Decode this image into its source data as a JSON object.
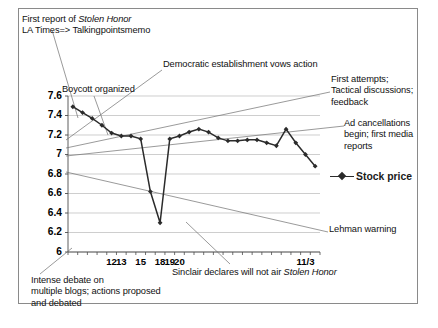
{
  "figure": {
    "border_color": "#8a8a8a",
    "background": "#ffffff"
  },
  "legend": {
    "label": "Stock price",
    "marker_icon": "line-diamond-marker-icon",
    "position": "right-middle"
  },
  "annotations": [
    {
      "id": "first-report",
      "lines": [
        "First report of |Stolen Honor|",
        "LA Times=> Talkingpointsmemo"
      ],
      "x": 22,
      "y": 14
    },
    {
      "id": "boycott",
      "lines": [
        "Boycott organized"
      ],
      "x": 62,
      "y": 84
    },
    {
      "id": "democratic",
      "lines": [
        "Democratic establishment vows action"
      ],
      "x": 163,
      "y": 59
    },
    {
      "id": "first-attempts",
      "lines": [
        "First attempts;",
        "Tactical discussions;",
        "feedback"
      ],
      "x": 331,
      "y": 74
    },
    {
      "id": "ad-cancellations",
      "lines": [
        "Ad cancellations",
        "begin; first media",
        "reports"
      ],
      "x": 344,
      "y": 118
    },
    {
      "id": "lehman",
      "lines": [
        "Lehman warning"
      ],
      "x": 329,
      "y": 224
    },
    {
      "id": "sinclair",
      "lines": [
        "Sinclair declares will not air |Stolen Honor|"
      ],
      "x": 172,
      "y": 267
    },
    {
      "id": "intense-debate",
      "lines": [
        "Intense debate on",
        "multiple blogs; actions proposed",
        "and debated"
      ],
      "x": 31,
      "y": 275
    }
  ],
  "chart_data": {
    "type": "line",
    "title": "",
    "xlabel": "",
    "ylabel": "",
    "ylim": [
      6,
      7.6
    ],
    "yticks": [
      6,
      6.2,
      6.4,
      6.6,
      6.8,
      7,
      7.2,
      7.4,
      7.6
    ],
    "ytick_labels": [
      "6",
      "6.2",
      "6.4",
      "6.6",
      "6.8",
      "7",
      "7.2",
      "7.4",
      "7.6"
    ],
    "grid": true,
    "legend_position": "right",
    "xtick_labels": [
      {
        "label": "12",
        "index": 4
      },
      {
        "label": "13",
        "index": 5
      },
      {
        "label": "15",
        "index": 7
      },
      {
        "label": "18",
        "index": 9
      },
      {
        "label": "19",
        "index": 10
      },
      {
        "label": "20",
        "index": 11
      },
      {
        "label": "11/3",
        "index": 24
      }
    ],
    "series": [
      {
        "name": "Stock price",
        "color": "#2b2b2b",
        "marker": "diamond",
        "values": [
          7.49,
          7.43,
          7.37,
          7.3,
          7.22,
          7.19,
          7.19,
          7.16,
          6.62,
          6.3,
          7.16,
          7.19,
          7.23,
          7.26,
          7.23,
          7.17,
          7.14,
          7.14,
          7.15,
          7.15,
          7.12,
          7.09,
          7.26,
          7.12,
          7.0,
          6.88
        ]
      }
    ]
  }
}
